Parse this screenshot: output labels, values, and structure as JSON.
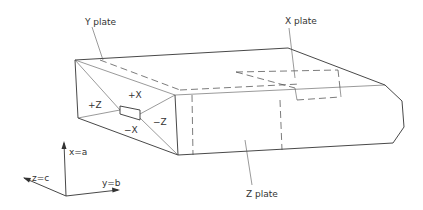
{
  "diagram": {
    "labels": {
      "y_plate": "Y plate",
      "x_plate": "X plate",
      "z_plate": "Z plate",
      "plus_x": "+X",
      "minus_x": "−X",
      "plus_z": "+Z",
      "minus_z": "−Z"
    },
    "axes": {
      "x_axis": "x=a",
      "y_axis": "y=b",
      "z_axis": "z=c"
    },
    "colors": {
      "line": "#333333",
      "background": "#ffffff"
    }
  }
}
